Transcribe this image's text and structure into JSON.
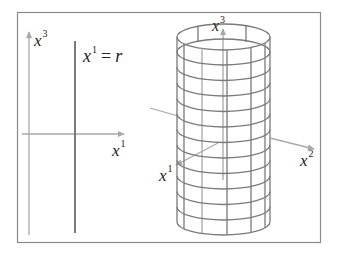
{
  "figure": {
    "frame": {
      "x": 17,
      "y": 12,
      "width": 303,
      "height": 230,
      "stroke": "#888888"
    },
    "colors": {
      "axis": "#a8a8a8",
      "line": "#6e6e6e",
      "grid": "#7a7a7a",
      "text": "#222222"
    },
    "left_panel": {
      "vertical_axis_label": {
        "base": "x",
        "superscript": "3"
      },
      "horizontal_axis_label": {
        "base": "x",
        "superscript": "1"
      },
      "line_label": {
        "base": "x",
        "superscript": "1",
        "equals": "=",
        "rhs": "r"
      }
    },
    "right_panel": {
      "object": "cylinder",
      "rings": 13,
      "vertical_lines": 8,
      "axis_labels": {
        "x3": {
          "base": "x",
          "superscript": "3"
        },
        "x1": {
          "base": "x",
          "superscript": "1"
        },
        "x2": {
          "base": "x",
          "superscript": "2"
        }
      }
    }
  }
}
